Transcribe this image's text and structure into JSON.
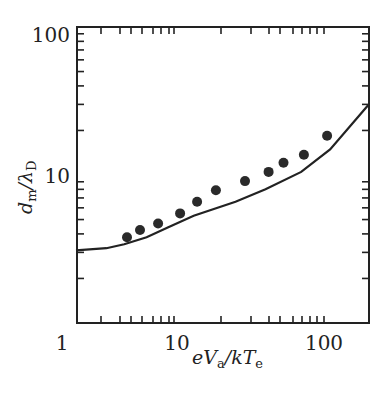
{
  "chart_data": {
    "type": "scatter",
    "title": "",
    "xlabel": "eVa/kTe",
    "ylabel": "dm/λD",
    "xscale": "log",
    "yscale": "log",
    "xlim": [
      1,
      200
    ],
    "ylim": [
      1,
      100
    ],
    "grid": false,
    "legend": null,
    "x_tick_labels": [
      "1",
      "10",
      "100"
    ],
    "y_tick_labels": [
      "100",
      "10"
    ],
    "series": [
      {
        "name": "measured",
        "kind": "points",
        "x": [
          3.2,
          4.3,
          6.5,
          10.5,
          13.7,
          18.4,
          29,
          42,
          53,
          73,
          105
        ],
        "y": [
          3.8,
          4.25,
          4.7,
          5.5,
          6.6,
          7.9,
          9.1,
          10.5,
          12.1,
          13.7,
          18.4
        ]
      },
      {
        "name": "theory",
        "kind": "line",
        "x": [
          1,
          2,
          3,
          5,
          8,
          13,
          25,
          40,
          70,
          110,
          200
        ],
        "y": [
          3.1,
          3.2,
          3.4,
          3.8,
          4.4,
          5.3,
          6.6,
          8.0,
          10.5,
          14.9,
          29.7
        ]
      }
    ]
  },
  "labels": {
    "y_100": "100",
    "y_10": "10",
    "x_1": "1",
    "x_10": "10",
    "x_100": "100",
    "xlabel_main_e": "eV",
    "xlabel_sub_a": "a",
    "xlabel_mid": "/kT",
    "xlabel_sub_e": "e",
    "ylabel_d": "d",
    "ylabel_sub_m": "m",
    "ylabel_mid": "/λ",
    "ylabel_sub_D": "D"
  },
  "style": {
    "ink": "#222222",
    "background": "#ffffff"
  }
}
